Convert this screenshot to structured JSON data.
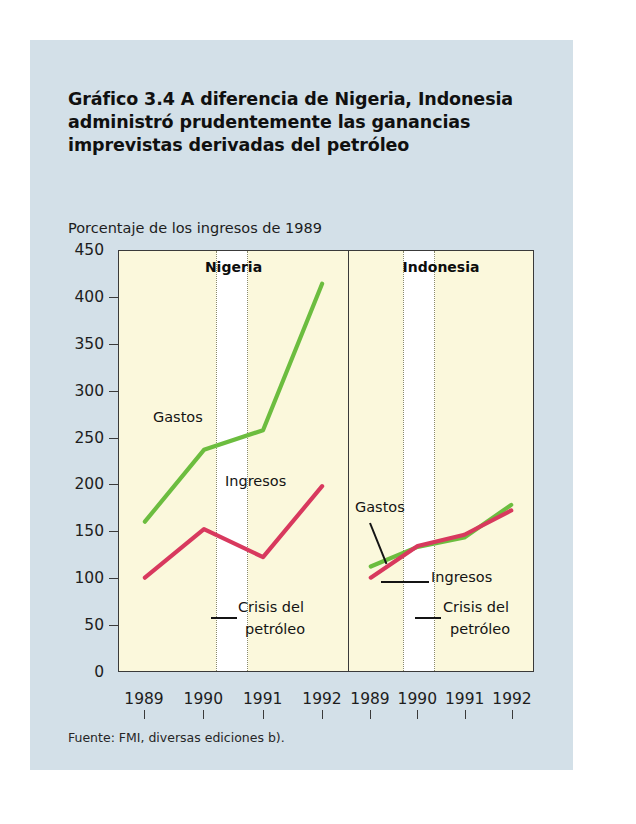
{
  "figure": {
    "title": "Gráfico 3.4  A diferencia de Nigeria, Indonesia administró prudentemente las ganancias imprevistas derivadas del petróleo",
    "axis_title": "Porcentaje de los ingresos de 1989",
    "source": "Fuente: FMI, diversas ediciones b).",
    "colors": {
      "expenditure": "#6cbd3f",
      "revenue": "#d8395e",
      "panel_background": "#fbf8dc",
      "figure_background": "#d3e0e8",
      "rule": "#111111"
    }
  },
  "annotations": {
    "nigeria_gastos": "Gastos",
    "nigeria_ingresos": "Ingresos",
    "nigeria_crisis_line1": "Crisis del",
    "nigeria_crisis_line2": "petróleo",
    "indonesia_gastos": "Gastos",
    "indonesia_ingresos": "Ingresos",
    "indonesia_crisis_line1": "Crisis del",
    "indonesia_crisis_line2": "petróleo"
  },
  "chart_data": {
    "type": "line",
    "title": "Gráfico 3.4  A diferencia de Nigeria, Indonesia administró prudentemente las ganancias imprevistas derivadas del petróleo",
    "ylabel": "Porcentaje de los ingresos de 1989",
    "xlabel": "",
    "ylim": [
      0,
      450
    ],
    "yticks": [
      0,
      50,
      100,
      150,
      200,
      250,
      300,
      350,
      400,
      450
    ],
    "ytick_labels": [
      "0",
      "50",
      "100",
      "150",
      "200",
      "250",
      "300",
      "350",
      "400",
      "450"
    ],
    "grid": false,
    "legend": "inline-annotations",
    "x": [
      1989,
      1990,
      1991,
      1992
    ],
    "xtick_labels": [
      "1989",
      "1990",
      "1991",
      "1992"
    ],
    "panels": [
      {
        "name": "Nigeria",
        "series": [
          {
            "name": "Gastos",
            "color": "#6cbd3f",
            "values": [
              160,
              237,
              258,
              415
            ]
          },
          {
            "name": "Ingresos",
            "color": "#d8395e",
            "values": [
              100,
              152,
              122,
              198
            ]
          }
        ],
        "shaded_band": {
          "label": "Crisis del petróleo",
          "from": 1989.5,
          "to": 1990.0
        }
      },
      {
        "name": "Indonesia",
        "series": [
          {
            "name": "Gastos",
            "color": "#6cbd3f",
            "values": [
              112,
              133,
              143,
              178
            ]
          },
          {
            "name": "Ingresos",
            "color": "#d8395e",
            "values": [
              100,
              134,
              146,
              172
            ]
          }
        ],
        "shaded_band": {
          "label": "Crisis del petróleo",
          "from": 1989.5,
          "to": 1990.0
        }
      }
    ]
  }
}
